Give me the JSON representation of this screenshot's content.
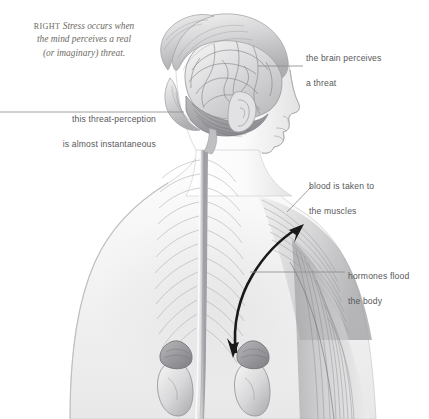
{
  "figure": {
    "background_color": "#ffffff",
    "caption": {
      "keyword": "RIGHT",
      "text": "Stress occurs when the mind perceives a real (or imaginary) threat.",
      "line1": "Stress occurs when",
      "line2": "the mind perceives a real",
      "line3": "(or imaginary) threat.",
      "color": "#6d6a63"
    },
    "label_color": "#58585a",
    "leader_color": "#8e8e90",
    "arrow_color": "#1a1a1a"
  },
  "labels": [
    {
      "id": "brain-perceives",
      "line1": "the brain perceives",
      "line2": "a threat",
      "align": "left",
      "points_to": "brain"
    },
    {
      "id": "threat-perception",
      "line1": "this threat-perception",
      "line2": "is almost instantaneous",
      "align": "right",
      "points_to": "cerebellum"
    },
    {
      "id": "blood-muscles",
      "line1": "blood is taken to",
      "line2": "the muscles",
      "align": "left",
      "points_to": "shoulder-muscle"
    },
    {
      "id": "hormones-body",
      "line1": "hormones flood",
      "line2": "the body",
      "align": "left",
      "points_to": "back-muscle"
    }
  ],
  "anatomy": {
    "parts": [
      "head-profile",
      "hair-bun",
      "brain",
      "cerebellum",
      "ear",
      "face-profile",
      "neck",
      "shoulder",
      "back-torso",
      "spinal-cord",
      "spinal-nerves",
      "trapezius-muscle",
      "latissimus-muscle",
      "left-kidney",
      "right-kidney",
      "left-adrenal-gland",
      "right-adrenal-gland"
    ],
    "arrow": {
      "id": "stress-response-arrow",
      "description": "double-headed curved arrow from adrenal gland to shoulder muscle",
      "heads": 2
    }
  }
}
